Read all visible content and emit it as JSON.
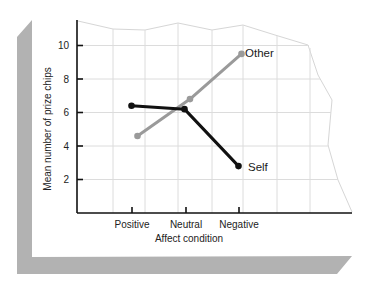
{
  "chart_data": {
    "type": "line",
    "title": "",
    "xlabel": "Affect condition",
    "ylabel": "Mean number of prize chips",
    "categories": [
      "Positive",
      "Neutral",
      "Negative"
    ],
    "yticks": [
      "2",
      "4",
      "6",
      "8",
      "10"
    ],
    "ylim": [
      0,
      11
    ],
    "grid": true,
    "legend": "inline labels at line ends",
    "series": [
      {
        "name": "Self",
        "color": "#111111",
        "values": [
          6.4,
          6.2,
          2.8
        ]
      },
      {
        "name": "Other",
        "color": "#9a9a9a",
        "values": [
          4.6,
          6.8,
          9.5
        ]
      }
    ]
  }
}
